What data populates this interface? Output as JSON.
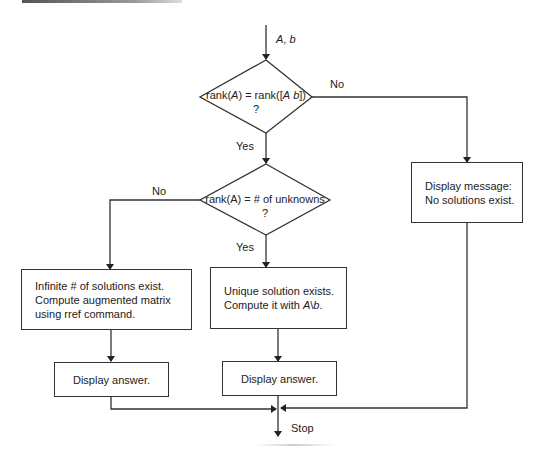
{
  "diagram": {
    "type": "flowchart",
    "input": {
      "label_A": "A",
      "label_sep": ", ",
      "label_b": "b"
    },
    "decision1": {
      "line1_parts": [
        "rank(",
        "A",
        ") = rank([",
        "A",
        " ",
        "b",
        "])"
      ],
      "line2": "?",
      "no_label": "No",
      "yes_label": "Yes"
    },
    "decision2": {
      "line1": "rank(A) = # of unknowns",
      "line2": "?",
      "no_label": "No",
      "yes_label": "Yes"
    },
    "no_solution_box": {
      "line1": "Display message:",
      "line2": "No solutions exist."
    },
    "infinite_box": {
      "line1": "Infinite # of solutions exist.",
      "line2": "Compute augmented matrix",
      "line3": "using rref command."
    },
    "unique_box": {
      "line1": "Unique solution exists.",
      "line2_prefix": "Compute it with ",
      "line2_A": "A",
      "line2_slash": "\\",
      "line2_b": "b",
      "line2_suffix": "."
    },
    "display_answer_left": "Display answer.",
    "display_answer_right": "Display answer.",
    "stop_label": "Stop",
    "colors": {
      "stroke": "#333333",
      "text": "#222222",
      "background": "#ffffff"
    }
  }
}
